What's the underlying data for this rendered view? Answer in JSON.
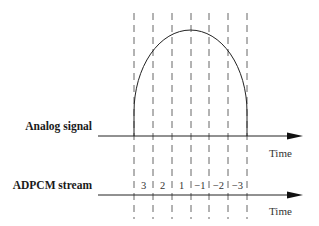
{
  "diagram": {
    "analog_row": {
      "label": "Analog signal",
      "axis_label": "Time"
    },
    "adpcm_row": {
      "label": "ADPCM stream",
      "axis_label": "Time",
      "values": [
        "3",
        "2",
        "1",
        "−1",
        "−2",
        "−3"
      ]
    },
    "sample_lines_x": [
      134,
      153,
      172,
      191,
      209,
      228,
      247
    ],
    "colors": {
      "stroke": "#222222",
      "dash": "#555555",
      "background": "#ffffff"
    }
  }
}
